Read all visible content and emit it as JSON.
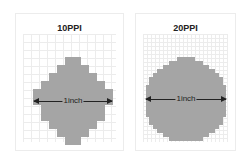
{
  "panels": [
    {
      "title": "10PPI",
      "arrow_label": "1inch"
    },
    {
      "title": "20PPI",
      "arrow_label": "1inch"
    }
  ],
  "colors": {
    "fill": "#a5a5a5",
    "grid": "#ececec",
    "arrow": "#222222"
  }
}
